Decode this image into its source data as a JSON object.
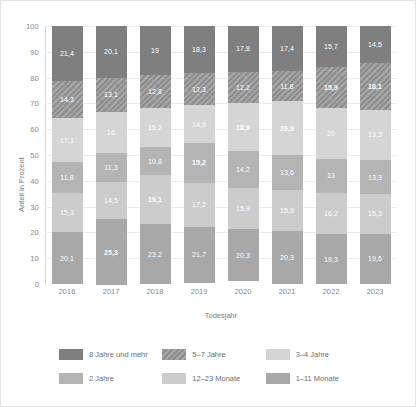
{
  "chart_data": {
    "type": "bar",
    "subtype": "stacked-percentage",
    "title": "",
    "xlabel": "Todesjahr",
    "ylabel": "Anteil in Prozent",
    "ylim": [
      0,
      100
    ],
    "ytick_step": 10,
    "yticks": [
      "100",
      "90",
      "80",
      "70",
      "60",
      "50",
      "40",
      "30",
      "20",
      "10",
      "0"
    ],
    "grid": true,
    "legend_position": "bottom",
    "categories": [
      "2016",
      "2017",
      "2018",
      "2019",
      "2020",
      "2021",
      "2022",
      "2023"
    ],
    "series": [
      {
        "name": "8 Jahre und mehr",
        "color": "#7f7f7f",
        "hatch": false,
        "values": [
          21.4,
          20.1,
          19.0,
          18.3,
          17.8,
          17.4,
          15.7,
          14.5
        ],
        "labels": [
          "21,4",
          "20,1",
          "19",
          "18,3",
          "17,8",
          "17,4",
          "15,7",
          "14,5"
        ],
        "bold": [
          false,
          false,
          false,
          false,
          false,
          false,
          false,
          false
        ]
      },
      {
        "name": "5–7 Jahre",
        "color": "#8e8e8e",
        "hatch": true,
        "values": [
          14.3,
          13.1,
          12.8,
          12.3,
          12.2,
          11.8,
          15.9,
          18.1
        ],
        "labels": [
          "14,3",
          "13,1",
          "12,8",
          "12,3",
          "12,2",
          "11,8",
          "15,9",
          "18,1"
        ],
        "bold": [
          false,
          false,
          false,
          false,
          false,
          false,
          true,
          true
        ]
      },
      {
        "name": "3–4 Jahre",
        "color": "#d5d5d5",
        "hatch": false,
        "values": [
          17.1,
          16.0,
          15.2,
          14.9,
          18.6,
          20.9,
          20.0,
          19.3
        ],
        "labels": [
          "17,1",
          "16",
          "15,2",
          "14,9",
          "18,6",
          "20,9",
          "20",
          "19,3"
        ],
        "bold": [
          false,
          false,
          false,
          false,
          true,
          true,
          false,
          false
        ]
      },
      {
        "name": "2 Jahre",
        "color": "#b4b4b4",
        "hatch": false,
        "values": [
          11.8,
          11.3,
          10.8,
          15.2,
          14.2,
          13.6,
          13.0,
          13.3
        ],
        "labels": [
          "11,8",
          "11,3",
          "10,8",
          "15,2",
          "14,2",
          "13,6",
          "13",
          "13,3"
        ],
        "bold": [
          false,
          false,
          false,
          true,
          false,
          false,
          false,
          false
        ]
      },
      {
        "name": "12–23 Monate",
        "color": "#cccccc",
        "hatch": false,
        "values": [
          15.3,
          14.5,
          19.1,
          17.2,
          15.9,
          15.9,
          16.2,
          15.3
        ],
        "labels": [
          "15,3",
          "14,5",
          "19,1",
          "17,2",
          "15,9",
          "15,9",
          "16,2",
          "15,3"
        ],
        "bold": [
          false,
          false,
          true,
          false,
          false,
          false,
          false,
          false
        ]
      },
      {
        "name": "1–11 Monate",
        "color": "#a8a8a8",
        "hatch": false,
        "values": [
          20.1,
          25.3,
          23.2,
          21.7,
          20.3,
          20.3,
          19.3,
          19.6
        ],
        "labels": [
          "20,1",
          "25,3",
          "23,2",
          "21,7",
          "20,3",
          "20,3",
          "19,3",
          "19,6"
        ],
        "bold": [
          false,
          true,
          false,
          false,
          false,
          false,
          false,
          false
        ]
      }
    ]
  }
}
